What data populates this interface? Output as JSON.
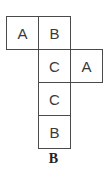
{
  "figure": {
    "type": "cube-net",
    "cells": [
      {
        "label": "A",
        "row": 0,
        "col": 0
      },
      {
        "label": "B",
        "row": 0,
        "col": 1
      },
      {
        "label": "C",
        "row": 1,
        "col": 1
      },
      {
        "label": "A",
        "row": 1,
        "col": 2
      },
      {
        "label": "C",
        "row": 2,
        "col": 1
      },
      {
        "label": "B",
        "row": 3,
        "col": 1
      }
    ],
    "caption": "B"
  }
}
